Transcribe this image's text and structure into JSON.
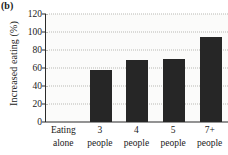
{
  "panel": {
    "label": "(b)"
  },
  "chart_data": {
    "type": "bar",
    "title": "",
    "subtitle": "",
    "xlabel": "",
    "ylabel": "Increased eating (%)",
    "categories": [
      "Eating alone",
      "3 people",
      "4 people",
      "5 people",
      "7+ people"
    ],
    "category_lines": [
      {
        "line1": "Eating",
        "line2": "alone"
      },
      {
        "line1": "3",
        "line2": "people"
      },
      {
        "line1": "4",
        "line2": "people"
      },
      {
        "line1": "5",
        "line2": "people"
      },
      {
        "line1": "7+",
        "line2": "people"
      }
    ],
    "values": [
      0,
      58,
      69,
      70,
      94
    ],
    "ylim": [
      0,
      120
    ],
    "ytick_labels": [
      "0",
      "20",
      "40",
      "60",
      "80",
      "100",
      "120"
    ],
    "ytick_values": [
      0,
      20,
      40,
      60,
      80,
      100,
      120
    ],
    "grid": true,
    "grid_style": "dotted",
    "legend": "none",
    "bar_color": "#262626",
    "grid_color": "#b9b9b4",
    "axis_color": "#2b2b2b",
    "plot_background": "#fbfbfa"
  }
}
